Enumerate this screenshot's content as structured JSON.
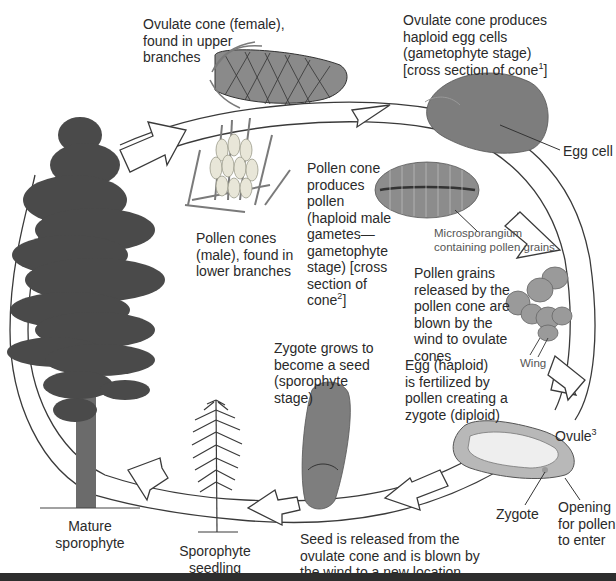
{
  "diagram": {
    "type": "life-cycle",
    "colors": {
      "background": "#ffffff",
      "arrow_stroke": "#3a3a3a",
      "arrow_fill": "#ffffff",
      "tree_foliage": "#4a4a4a",
      "trunk": "#6b6b6b",
      "text": "#2a2a2a",
      "bottom_bar": "#2e2e2e"
    },
    "stages": [
      {
        "id": "ovulate-cone",
        "label": "Ovulate cone (female),\nfound in upper\nbranches"
      },
      {
        "id": "ovulate-cross-section",
        "label": "Ovulate cone produces\nhaploid egg cells\n(gametophyte stage)\n[cross section of cone",
        "superscript": "1",
        "suffix": "]"
      },
      {
        "id": "egg-cell",
        "label": "Egg cell"
      },
      {
        "id": "pollen-cones",
        "label": "Pollen cones\n(male), found in\nlower branches"
      },
      {
        "id": "pollen-cone-produces",
        "label": "Pollen cone\nproduces\npollen\n(haploid male\ngametes—\ngametophyte\nstage) [cross\nsection of\ncone",
        "superscript": "2",
        "suffix": "]"
      },
      {
        "id": "microsporangium",
        "label": "Microsporangium\ncontaining pollen grains"
      },
      {
        "id": "pollen-grains",
        "label": "Pollen grains\nreleased by the\npollen cone are\nblown by the\nwind to ovulate\ncones"
      },
      {
        "id": "wing",
        "label": "Wing"
      },
      {
        "id": "fertilization",
        "label": "Egg (haploid)\nis fertilized by\npollen creating a\nzygote (diploid)"
      },
      {
        "id": "ovule",
        "label": "Ovule",
        "superscript": "3"
      },
      {
        "id": "zygote",
        "label": "Zygote"
      },
      {
        "id": "opening",
        "label": "Opening\nfor pollen\nto enter"
      },
      {
        "id": "seed",
        "label": "Zygote grows to\nbecome a seed\n(sporophyte\nstage)"
      },
      {
        "id": "seed-release",
        "label": "Seed is released from the\novulate cone and is blown by\nthe wind to a new location"
      },
      {
        "id": "seedling",
        "label": "Sporophyte\nseedling"
      },
      {
        "id": "mature",
        "label": "Mature\nsporophyte"
      }
    ],
    "flow": [
      "mature",
      "ovulate-cone",
      "ovulate-cross-section",
      "pollen-grains",
      "fertilization",
      "seed-release",
      "seedling",
      "mature"
    ]
  }
}
